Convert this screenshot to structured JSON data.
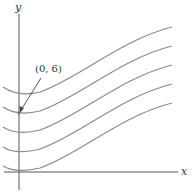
{
  "figure": {
    "type": "family-of-curves",
    "axes": {
      "x_label": "x",
      "y_label": "y"
    },
    "annotation": {
      "label": "(0, 6)",
      "point": [
        0,
        6
      ]
    },
    "curve_color": "#8a8a8a",
    "axis_color": "#555555",
    "curve_count": 5
  }
}
